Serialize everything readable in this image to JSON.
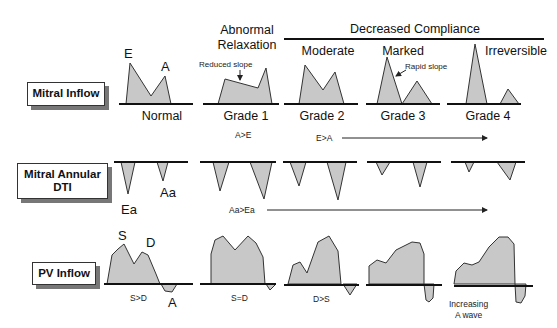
{
  "title_headers": {
    "abnormal_relaxation": [
      "Abnormal",
      "Relaxation"
    ],
    "decreased_compliance": "Decreased Compliance",
    "moderate": "Moderate",
    "marked": "Marked",
    "irreversible": "Irreversible"
  },
  "row_labels": {
    "mitral_inflow": "Mitral Inflow",
    "mitral_annular_dti": [
      "Mitral Annular",
      "DTI"
    ],
    "pv_inflow": "PV Inflow"
  },
  "grades": [
    "Normal",
    "Grade 1",
    "Grade 2",
    "Grade 3",
    "Grade 4"
  ],
  "mitral_inflow": {
    "peak_labels": {
      "e": "E",
      "a": "A"
    },
    "annotations": {
      "reduced_slope": "Reduced slope",
      "rapid_slope": "Rapid slope"
    },
    "ratio_labels": {
      "grade1": "A>E",
      "grade2_4": "E>A"
    }
  },
  "mitral_annular": {
    "peak_labels": {
      "ea": "Ea",
      "aa": "Aa"
    },
    "ratio_labels": {
      "grade1_4": "Aa>Ea"
    }
  },
  "pv_inflow": {
    "peak_labels": {
      "s": "S",
      "d": "D",
      "a": "A"
    },
    "ratio_labels": {
      "normal": "S>D",
      "grade1": "S=D",
      "grade2": "D>S"
    },
    "note": [
      "Increasing",
      "A wave"
    ]
  },
  "colors": {
    "fill": "#c8c8c8",
    "stroke": "#333333",
    "baseline": "#111111",
    "shadow": "#777777"
  }
}
